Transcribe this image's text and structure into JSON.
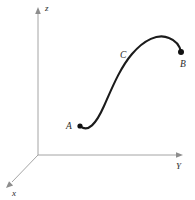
{
  "figure": {
    "background_color": "#ffffff",
    "width": 195,
    "height": 200
  },
  "axes": {
    "origin": {
      "x": 38,
      "y": 155
    },
    "color": "#9a9a9a",
    "items": [
      {
        "name": "z-axis",
        "label": "z",
        "label_x": 45,
        "label_y": 11,
        "from": {
          "x": 38,
          "y": 155
        },
        "to": {
          "x": 38,
          "y": 13
        },
        "arrow_points": "38,7 35.2,14 40.8,14"
      },
      {
        "name": "y-axis",
        "label": "Y",
        "label_x": 176,
        "label_y": 169,
        "from": {
          "x": 38,
          "y": 155
        },
        "to": {
          "x": 176,
          "y": 155
        },
        "arrow_points": "183,155 176,152.2 176,157.8"
      },
      {
        "name": "x-axis",
        "label": "x",
        "label_x": 12,
        "label_y": 196,
        "from": {
          "x": 38,
          "y": 155
        },
        "to": {
          "x": 12,
          "y": 182
        },
        "arrow_points": "6,188 13.1,185.6 9.0,181.3"
      }
    ]
  },
  "curve": {
    "name": "curve-C",
    "label": "C",
    "label_x": 120,
    "label_y": 58,
    "color": "#1b1b1b",
    "stroke_width": 2.1,
    "path": "M 80,126 C 88,133 96,124 104,106 C 112,88 120,68 132,54 C 144,40 158,33 169,38 C 177,41 180,47 181,52"
  },
  "points": [
    {
      "name": "point-A",
      "label": "A",
      "x": 80,
      "y": 126,
      "radius": 2.6,
      "label_x": 66,
      "label_y": 129
    },
    {
      "name": "point-B",
      "label": "B",
      "x": 181,
      "y": 52,
      "radius": 3.0,
      "label_x": 180,
      "label_y": 67
    }
  ]
}
